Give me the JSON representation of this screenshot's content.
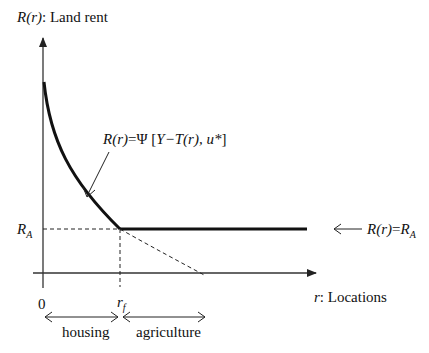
{
  "figure": {
    "type": "bid-rent land rent diagram",
    "y_axis": {
      "label_symbol": "R(r)",
      "label_text": ": Land rent",
      "tick_label": "R",
      "tick_label_sub": "A"
    },
    "x_axis": {
      "label_symbol": "r",
      "label_text": ": Locations",
      "origin_label": "0",
      "tick_label": "r",
      "tick_label_sub": "f"
    },
    "curve_annotation": {
      "lhs": "R(r)",
      "eq": "=",
      "psi": "Ψ",
      "bracket_open": " [",
      "args": "Y−T(r), u*",
      "bracket_close": "]"
    },
    "flat_annotation": {
      "lhs": "R(r)",
      "eq": "=",
      "rhs": "R",
      "rhs_sub": "A"
    },
    "zones": [
      {
        "label": "housing"
      },
      {
        "label": "agriculture"
      }
    ],
    "colors": {
      "line": "#111111",
      "axis": "#333333",
      "background": "#ffffff"
    }
  }
}
